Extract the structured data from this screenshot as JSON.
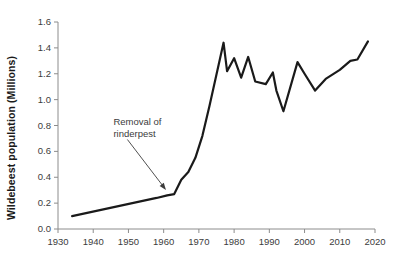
{
  "chart_data": {
    "type": "line",
    "title": "",
    "xlabel": "",
    "ylabel": "Wildebeest population (Millions)",
    "xlim": [
      1930,
      2020
    ],
    "ylim": [
      0.0,
      1.6
    ],
    "grid": false,
    "legend": "none",
    "x_ticks": [
      1930,
      1940,
      1950,
      1960,
      1970,
      1980,
      1990,
      2000,
      2010,
      2020
    ],
    "x_tick_labels": [
      "1930",
      "1940",
      "1950",
      "1960",
      "1970",
      "1980",
      "1990",
      "2000",
      "2010",
      "2020"
    ],
    "y_ticks": [
      0.0,
      0.2,
      0.4,
      0.6,
      0.8,
      1.0,
      1.2,
      1.4,
      1.6
    ],
    "y_tick_labels": [
      "0.0",
      "0.2",
      "0.4",
      "0.6",
      "0.8",
      "1.0",
      "1.2",
      "1.4",
      "1.6"
    ],
    "series": [
      {
        "name": "Wildebeest population",
        "color": "#1a1a1a",
        "x": [
          1934,
          1958,
          1961,
          1963,
          1965,
          1967,
          1969,
          1971,
          1973,
          1977,
          1978,
          1980,
          1982,
          1984,
          1986,
          1989,
          1991,
          1992,
          1994,
          1998,
          2000,
          2003,
          2006,
          2010,
          2013,
          2015,
          2018
        ],
        "values": [
          0.1,
          0.24,
          0.26,
          0.27,
          0.38,
          0.44,
          0.55,
          0.72,
          0.95,
          1.44,
          1.22,
          1.32,
          1.17,
          1.33,
          1.14,
          1.12,
          1.21,
          1.07,
          0.91,
          1.29,
          1.2,
          1.07,
          1.16,
          1.23,
          1.3,
          1.31,
          1.45
        ]
      }
    ],
    "annotations": [
      {
        "name": "removal-of-rinderpest",
        "line1": "Removal of",
        "line2": "rinderpest",
        "target_x": 1961,
        "target_y": 0.29,
        "text_x": 1948,
        "text_y": 0.8
      }
    ]
  },
  "axis_style": {
    "axis_color": "#8c8c8c",
    "tick_color": "#8c8c8c",
    "text_color": "#3c3c3c",
    "line_color": "#1a1a1a",
    "background": "#ffffff"
  }
}
